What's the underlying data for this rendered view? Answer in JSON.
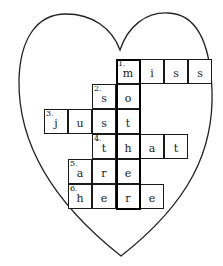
{
  "puzzle": {
    "shape": "heart",
    "outline_color": "#222222",
    "highlight_column_word": "mother",
    "rows": [
      {
        "number": "1.",
        "word": "miss",
        "letters": [
          "m",
          "i",
          "s",
          "s"
        ],
        "start_col": 3,
        "row": 0
      },
      {
        "number": "2.",
        "word": "so",
        "letters": [
          "s",
          "o"
        ],
        "start_col": 2,
        "row": 1
      },
      {
        "number": "3.",
        "word": "just",
        "letters": [
          "j",
          "u",
          "s",
          "t"
        ],
        "start_col": 0,
        "row": 2
      },
      {
        "number": "4.",
        "word": "that",
        "letters": [
          "t",
          "h",
          "a",
          "t"
        ],
        "start_col": 2,
        "row": 3
      },
      {
        "number": "5.",
        "word": "are",
        "letters": [
          "a",
          "r",
          "e"
        ],
        "start_col": 1,
        "row": 4
      },
      {
        "number": "6.",
        "word": "here",
        "letters": [
          "h",
          "e",
          "r",
          "e"
        ],
        "start_col": 1,
        "row": 5
      }
    ]
  }
}
